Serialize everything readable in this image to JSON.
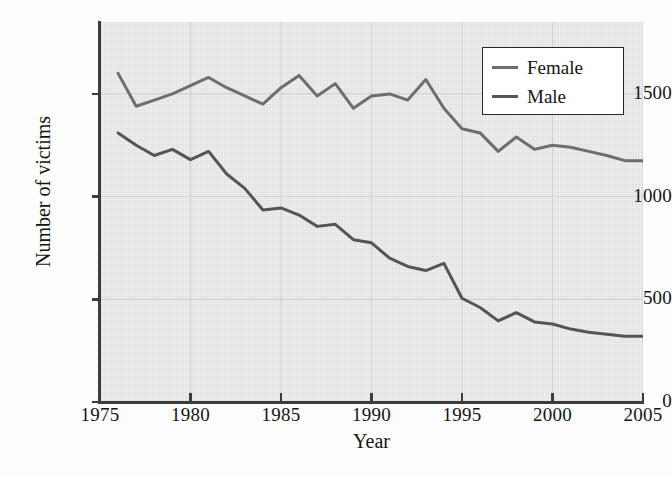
{
  "figure": {
    "background_color": "#fdfdfd",
    "plot_background_color": "#e6e6e6",
    "grid_color": "#cfcfcf",
    "axis_color": "#3c3c3c"
  },
  "axes": {
    "x_title": "Year",
    "y_title": "Number of victims",
    "x_ticks": [
      "1975",
      "1980",
      "1985",
      "1990",
      "1995",
      "2000",
      "2005"
    ],
    "y_ticks": [
      "0",
      "500",
      "1000",
      "1500"
    ]
  },
  "legend": {
    "position": "top-right",
    "entries": [
      {
        "label": "Female",
        "color": "#6e6e6e"
      },
      {
        "label": "Male",
        "color": "#555555"
      }
    ]
  },
  "chart_data": {
    "type": "line",
    "title": "",
    "subtitle": "",
    "xlabel": "Year",
    "ylabel": "Number of victims",
    "xlim": [
      1975,
      2005
    ],
    "ylim": [
      0,
      1850
    ],
    "grid": true,
    "legend_position": "top-right",
    "x": [
      1976,
      1977,
      1978,
      1979,
      1980,
      1981,
      1982,
      1983,
      1984,
      1985,
      1986,
      1987,
      1988,
      1989,
      1990,
      1991,
      1992,
      1993,
      1994,
      1995,
      1996,
      1997,
      1998,
      1999,
      2000,
      2001,
      2002,
      2003,
      2004,
      2005
    ],
    "series": [
      {
        "name": "Female",
        "color": "#6e6e6e",
        "values": [
          1600,
          1440,
          1470,
          1500,
          1540,
          1580,
          1530,
          1490,
          1450,
          1530,
          1590,
          1490,
          1550,
          1430,
          1490,
          1500,
          1470,
          1570,
          1430,
          1330,
          1310,
          1220,
          1290,
          1230,
          1250,
          1240,
          1220,
          1200,
          1175,
          1175
        ]
      },
      {
        "name": "Male",
        "color": "#555555",
        "values": [
          1310,
          1250,
          1200,
          1230,
          1180,
          1220,
          1110,
          1040,
          935,
          945,
          910,
          855,
          865,
          790,
          775,
          700,
          660,
          640,
          675,
          505,
          460,
          395,
          435,
          390,
          380,
          355,
          340,
          330,
          320,
          320
        ]
      }
    ]
  }
}
